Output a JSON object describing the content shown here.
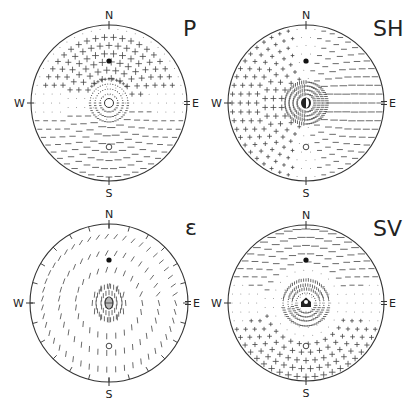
{
  "figure": {
    "width": 408,
    "height": 410,
    "stroke_color": "#333333",
    "glyph_color": "#444444"
  },
  "panels": [
    {
      "id": "P",
      "title": "P",
      "cx": 109,
      "cy": 103,
      "r": 78,
      "title_x": 183,
      "title_y": 36,
      "compass": {
        "N": "N",
        "S": "S",
        "W": "W",
        "E": "E"
      },
      "filled_dot": {
        "dx": 0,
        "dy": -42
      },
      "open_dot": {
        "dx": 0,
        "dy": 44
      },
      "center_marker": "open-circle",
      "pattern": "P",
      "rim_ticks": false
    },
    {
      "id": "SH",
      "title": "SH",
      "cx": 306,
      "cy": 103,
      "r": 78,
      "title_x": 373,
      "title_y": 36,
      "compass": {
        "N": "N",
        "S": "S",
        "W": "W",
        "E": "E"
      },
      "filled_dot": {
        "dx": 0,
        "dy": -42
      },
      "open_dot": {
        "dx": 0,
        "dy": 44
      },
      "center_marker": "half-filled",
      "pattern": "SH",
      "rim_ticks": false
    },
    {
      "id": "epsilon",
      "title": "ε",
      "cx": 109,
      "cy": 303,
      "r": 79,
      "title_x": 185,
      "title_y": 235,
      "compass": {
        "N": "N",
        "S": "S",
        "W": "W",
        "E": "E"
      },
      "filled_dot": {
        "dx": 0,
        "dy": -43
      },
      "open_dot": {
        "dx": 0,
        "dy": 43
      },
      "center_marker": "striped-oval",
      "pattern": "EPS",
      "rim_ticks": true
    },
    {
      "id": "SV",
      "title": "SV",
      "cx": 306,
      "cy": 303,
      "r": 78,
      "title_x": 373,
      "title_y": 236,
      "compass": {
        "N": "N",
        "S": "S",
        "W": "W",
        "E": "E"
      },
      "filled_dot": {
        "dx": 0,
        "dy": -43
      },
      "open_dot": {
        "dx": 0,
        "dy": 43
      },
      "center_marker": "pentagon",
      "pattern": "SV",
      "rim_ticks": false
    }
  ]
}
